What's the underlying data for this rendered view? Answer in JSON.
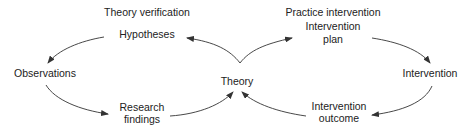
{
  "diagram": {
    "left_cycle": {
      "title": "Theory verification",
      "nodes": {
        "hypotheses": "Hypotheses",
        "observations": "Observations",
        "research_findings_line1": "Research",
        "research_findings_line2": "findings"
      }
    },
    "center": {
      "theory": "Theory"
    },
    "right_cycle": {
      "title": "Practice intervention",
      "nodes": {
        "intervention_plan_line1": "Intervention",
        "intervention_plan_line2": "plan",
        "intervention": "Intervention",
        "intervention_outcome_line1": "Intervention",
        "intervention_outcome_line2": "outcome"
      }
    },
    "edges": [
      {
        "from": "Theory",
        "to": "Hypotheses"
      },
      {
        "from": "Hypotheses",
        "to": "Observations"
      },
      {
        "from": "Observations",
        "to": "Research findings"
      },
      {
        "from": "Research findings",
        "to": "Theory"
      },
      {
        "from": "Theory",
        "to": "Intervention plan"
      },
      {
        "from": "Intervention plan",
        "to": "Intervention"
      },
      {
        "from": "Intervention",
        "to": "Intervention outcome"
      },
      {
        "from": "Intervention outcome",
        "to": "Theory"
      }
    ]
  }
}
